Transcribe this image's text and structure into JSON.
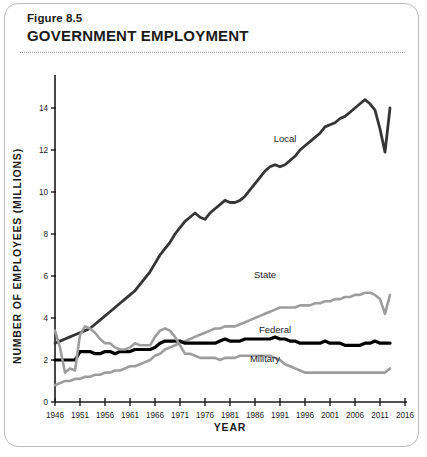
{
  "figure": {
    "number": "Figure 8.5",
    "title": "GOVERNMENT EMPLOYMENT"
  },
  "chart_data": {
    "type": "line",
    "title": "GOVERNMENT EMPLOYMENT",
    "xlabel": "YEAR",
    "ylabel": "NUMBER OF EMPLOYEES (MILLIONS)",
    "xlim": [
      1946,
      2016
    ],
    "ylim": [
      0,
      15
    ],
    "xticks": [
      1946,
      1951,
      1956,
      1961,
      1966,
      1971,
      1976,
      1981,
      1986,
      1991,
      1996,
      2001,
      2006,
      2011,
      2016
    ],
    "yticks": [
      0,
      2,
      4,
      6,
      8,
      10,
      12,
      14
    ],
    "grid": false,
    "legend_position": "inline-labels",
    "colors": {
      "dark": "#353535",
      "gray": "#9d9d9d",
      "black": "#000000"
    },
    "series": [
      {
        "name": "Local",
        "color": "#353535",
        "width": 2.8,
        "label_x": 1992,
        "label_y": 12.4,
        "x": [
          1946,
          1947,
          1948,
          1949,
          1950,
          1951,
          1952,
          1953,
          1954,
          1955,
          1956,
          1957,
          1958,
          1959,
          1960,
          1961,
          1962,
          1963,
          1964,
          1965,
          1966,
          1967,
          1968,
          1969,
          1970,
          1971,
          1972,
          1973,
          1974,
          1975,
          1976,
          1977,
          1978,
          1979,
          1980,
          1981,
          1982,
          1983,
          1984,
          1985,
          1986,
          1987,
          1988,
          1989,
          1990,
          1991,
          1992,
          1993,
          1994,
          1995,
          1996,
          1997,
          1998,
          1999,
          2000,
          2001,
          2002,
          2003,
          2004,
          2005,
          2006,
          2007,
          2008,
          2009,
          2010,
          2011,
          2012,
          2013
        ],
        "values": [
          2.8,
          2.9,
          3.0,
          3.1,
          3.2,
          3.3,
          3.4,
          3.5,
          3.7,
          3.9,
          4.1,
          4.3,
          4.5,
          4.7,
          4.9,
          5.1,
          5.3,
          5.6,
          5.9,
          6.2,
          6.6,
          7.0,
          7.3,
          7.6,
          8.0,
          8.3,
          8.6,
          8.8,
          9.0,
          8.8,
          8.7,
          9.0,
          9.2,
          9.4,
          9.6,
          9.5,
          9.5,
          9.6,
          9.8,
          10.1,
          10.4,
          10.7,
          11.0,
          11.2,
          11.3,
          11.2,
          11.3,
          11.5,
          11.7,
          12.0,
          12.2,
          12.4,
          12.6,
          12.8,
          13.1,
          13.2,
          13.3,
          13.5,
          13.6,
          13.8,
          14.0,
          14.2,
          14.4,
          14.2,
          13.9,
          13.0,
          11.9,
          14.0
        ]
      },
      {
        "name": "State",
        "color": "#9d9d9d",
        "width": 2.6,
        "label_x": 1988,
        "label_y": 5.9,
        "x": [
          1946,
          1947,
          1948,
          1949,
          1950,
          1951,
          1952,
          1953,
          1954,
          1955,
          1956,
          1957,
          1958,
          1959,
          1960,
          1961,
          1962,
          1963,
          1964,
          1965,
          1966,
          1967,
          1968,
          1969,
          1970,
          1971,
          1972,
          1973,
          1974,
          1975,
          1976,
          1977,
          1978,
          1979,
          1980,
          1981,
          1982,
          1983,
          1984,
          1985,
          1986,
          1987,
          1988,
          1989,
          1990,
          1991,
          1992,
          1993,
          1994,
          1995,
          1996,
          1997,
          1998,
          1999,
          2000,
          2001,
          2002,
          2003,
          2004,
          2005,
          2006,
          2007,
          2008,
          2009,
          2010,
          2011,
          2012,
          2013
        ],
        "values": [
          0.8,
          0.9,
          1.0,
          1.0,
          1.1,
          1.1,
          1.2,
          1.2,
          1.3,
          1.3,
          1.4,
          1.4,
          1.5,
          1.5,
          1.6,
          1.7,
          1.7,
          1.8,
          1.9,
          2.0,
          2.2,
          2.3,
          2.5,
          2.6,
          2.7,
          2.8,
          2.9,
          3.0,
          3.1,
          3.2,
          3.3,
          3.4,
          3.5,
          3.5,
          3.6,
          3.6,
          3.6,
          3.7,
          3.8,
          3.9,
          4.0,
          4.1,
          4.2,
          4.3,
          4.4,
          4.5,
          4.5,
          4.5,
          4.5,
          4.6,
          4.6,
          4.6,
          4.7,
          4.7,
          4.8,
          4.8,
          4.9,
          4.9,
          5.0,
          5.0,
          5.1,
          5.1,
          5.2,
          5.2,
          5.1,
          4.9,
          4.2,
          5.1
        ]
      },
      {
        "name": "Federal",
        "color": "#000000",
        "width": 3.2,
        "label_x": 1990,
        "label_y": 3.3,
        "x": [
          1946,
          1947,
          1948,
          1949,
          1950,
          1951,
          1952,
          1953,
          1954,
          1955,
          1956,
          1957,
          1958,
          1959,
          1960,
          1961,
          1962,
          1963,
          1964,
          1965,
          1966,
          1967,
          1968,
          1969,
          1970,
          1971,
          1972,
          1973,
          1974,
          1975,
          1976,
          1977,
          1978,
          1979,
          1980,
          1981,
          1982,
          1983,
          1984,
          1985,
          1986,
          1987,
          1988,
          1989,
          1990,
          1991,
          1992,
          1993,
          1994,
          1995,
          1996,
          1997,
          1998,
          1999,
          2000,
          2001,
          2002,
          2003,
          2004,
          2005,
          2006,
          2007,
          2008,
          2009,
          2010,
          2011,
          2012,
          2013
        ],
        "values": [
          2.0,
          2.0,
          2.0,
          2.0,
          2.0,
          2.4,
          2.4,
          2.4,
          2.3,
          2.3,
          2.4,
          2.4,
          2.3,
          2.4,
          2.4,
          2.4,
          2.5,
          2.5,
          2.5,
          2.5,
          2.6,
          2.8,
          2.9,
          2.9,
          2.9,
          2.9,
          2.8,
          2.8,
          2.8,
          2.8,
          2.8,
          2.8,
          2.8,
          2.9,
          3.0,
          2.9,
          2.9,
          2.9,
          3.0,
          3.0,
          3.0,
          3.0,
          3.0,
          3.0,
          3.1,
          3.0,
          3.0,
          2.9,
          2.9,
          2.8,
          2.8,
          2.8,
          2.8,
          2.8,
          2.9,
          2.8,
          2.8,
          2.8,
          2.7,
          2.7,
          2.7,
          2.7,
          2.8,
          2.8,
          2.9,
          2.8,
          2.8,
          2.8
        ]
      },
      {
        "name": "Military",
        "color": "#9d9d9d",
        "width": 2.6,
        "label_x": 1988,
        "label_y": 1.9,
        "x": [
          1946,
          1947,
          1948,
          1949,
          1950,
          1951,
          1952,
          1953,
          1954,
          1955,
          1956,
          1957,
          1958,
          1959,
          1960,
          1961,
          1962,
          1963,
          1964,
          1965,
          1966,
          1967,
          1968,
          1969,
          1970,
          1971,
          1972,
          1973,
          1974,
          1975,
          1976,
          1977,
          1978,
          1979,
          1980,
          1981,
          1982,
          1983,
          1984,
          1985,
          1986,
          1987,
          1988,
          1989,
          1990,
          1991,
          1992,
          1993,
          1994,
          1995,
          1996,
          1997,
          1998,
          1999,
          2000,
          2001,
          2002,
          2003,
          2004,
          2005,
          2006,
          2007,
          2008,
          2009,
          2010,
          2011,
          2012,
          2013
        ],
        "values": [
          3.4,
          2.6,
          1.4,
          1.6,
          1.5,
          3.2,
          3.6,
          3.5,
          3.3,
          3.0,
          2.8,
          2.8,
          2.6,
          2.5,
          2.5,
          2.6,
          2.8,
          2.7,
          2.7,
          2.7,
          3.1,
          3.4,
          3.5,
          3.4,
          3.1,
          2.7,
          2.3,
          2.3,
          2.2,
          2.1,
          2.1,
          2.1,
          2.1,
          2.0,
          2.1,
          2.1,
          2.1,
          2.2,
          2.2,
          2.2,
          2.2,
          2.2,
          2.2,
          2.2,
          2.1,
          2.0,
          1.8,
          1.7,
          1.6,
          1.5,
          1.4,
          1.4,
          1.4,
          1.4,
          1.4,
          1.4,
          1.4,
          1.4,
          1.4,
          1.4,
          1.4,
          1.4,
          1.4,
          1.4,
          1.4,
          1.4,
          1.4,
          1.6
        ]
      }
    ]
  }
}
